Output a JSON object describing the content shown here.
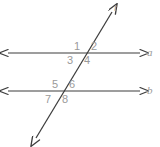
{
  "figure": {
    "type": "geometry-diagram",
    "colors": {
      "stroke": "#3d3d3d",
      "label": "#9a9a9a",
      "background": "#ffffff"
    },
    "lines": [
      {
        "id": "line-a",
        "label": "a",
        "label_x": 147,
        "label_y": 47,
        "x1": 8,
        "y1": 53,
        "x2": 140,
        "y2": 53,
        "arrows": "both"
      },
      {
        "id": "line-b",
        "label": "b",
        "label_x": 147,
        "label_y": 85,
        "x1": 8,
        "y1": 91,
        "x2": 140,
        "y2": 91,
        "arrows": "both"
      },
      {
        "id": "transversal-t",
        "label": "t",
        "label_x": 114,
        "label_y": 2,
        "x1": 36,
        "y1": 138,
        "x2": 112,
        "y2": 12,
        "arrows": "both"
      }
    ],
    "intersections": [
      {
        "id": "intersection-top",
        "on_line": "a",
        "x": 84,
        "y": 53
      },
      {
        "id": "intersection-bottom",
        "on_line": "b",
        "x": 61,
        "y": 91
      }
    ],
    "angles": [
      {
        "id": "angle-1",
        "label": "1",
        "x": 74,
        "y": 41,
        "position": "upper-left",
        "intersection": "intersection-top"
      },
      {
        "id": "angle-2",
        "label": "2",
        "x": 91,
        "y": 41,
        "position": "upper-right",
        "intersection": "intersection-top"
      },
      {
        "id": "angle-3",
        "label": "3",
        "x": 67,
        "y": 55,
        "position": "lower-left",
        "intersection": "intersection-top"
      },
      {
        "id": "angle-4",
        "label": "4",
        "x": 84,
        "y": 55,
        "position": "lower-right",
        "intersection": "intersection-top"
      },
      {
        "id": "angle-5",
        "label": "5",
        "x": 52,
        "y": 79,
        "position": "upper-left",
        "intersection": "intersection-bottom"
      },
      {
        "id": "angle-6",
        "label": "6",
        "x": 69,
        "y": 79,
        "position": "upper-right",
        "intersection": "intersection-bottom"
      },
      {
        "id": "angle-7",
        "label": "7",
        "x": 45,
        "y": 94,
        "position": "lower-left",
        "intersection": "intersection-bottom"
      },
      {
        "id": "angle-8",
        "label": "8",
        "x": 62,
        "y": 94,
        "position": "lower-right",
        "intersection": "intersection-bottom"
      }
    ]
  }
}
